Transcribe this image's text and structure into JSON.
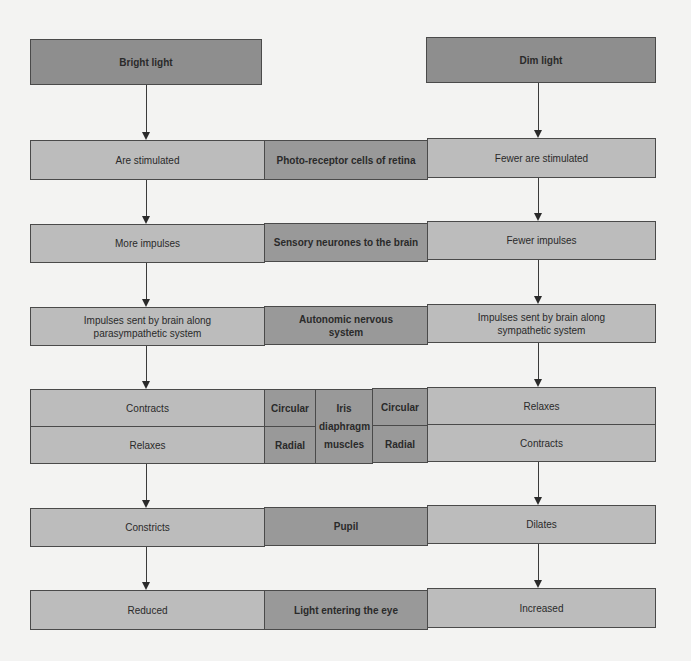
{
  "top": {
    "left": "Bright light",
    "right": "Dim light"
  },
  "rows": [
    {
      "left": "Are stimulated",
      "middle": "Photo-receptor cells of retina",
      "right": "Fewer are stimulated"
    },
    {
      "left": "More impulses",
      "middle": "Sensory neurones to the brain",
      "right": "Fewer impulses"
    },
    {
      "left": "Impulses sent by brain along parasympathetic system",
      "middle": "Autonomic nervous system",
      "right": "Impulses sent by brain along sympathetic system"
    },
    {
      "left": "Constricts",
      "middle": "Pupil",
      "right": "Dilates"
    },
    {
      "left": "Reduced",
      "middle": "Light entering the eye",
      "right": "Increased"
    }
  ],
  "iris": {
    "left_top": "Contracts",
    "left_bottom": "Relaxes",
    "circular_left": "Circular",
    "radial_left": "Radial",
    "center": "Iris diaphragm muscles",
    "circular_right": "Circular",
    "radial_right": "Radial",
    "right_top": "Relaxes",
    "right_bottom": "Contracts"
  }
}
